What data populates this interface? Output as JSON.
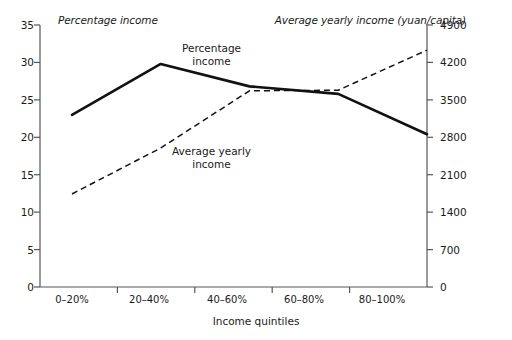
{
  "chart_data": {
    "type": "line",
    "title": "",
    "xlabel": "Income quintiles",
    "categories": [
      "0–20%",
      "20–40%",
      "40–60%",
      "60–80%",
      "80–100%"
    ],
    "grid": false,
    "legend_position": "inline-annotations",
    "axes": {
      "left": {
        "label": "Percentage income",
        "ylim": [
          0,
          35
        ],
        "ticks": [
          0,
          5,
          10,
          15,
          20,
          25,
          30,
          35
        ],
        "tick_labels": [
          "0",
          "5",
          "10",
          "15",
          "20",
          "25",
          "30",
          "35"
        ]
      },
      "right": {
        "label": "Average yearly income (yuan/capita)",
        "ylim": [
          0,
          4900
        ],
        "ticks": [
          0,
          700,
          1400,
          2100,
          2800,
          3500,
          4200,
          4900
        ],
        "tick_labels": [
          "0",
          "700",
          "1400",
          "2100",
          "2800",
          "3500",
          "4200",
          "4900"
        ]
      }
    },
    "series": [
      {
        "name": "Percentage income",
        "axis": "left",
        "style": "solid",
        "color": "#111111",
        "annotation": "Percentage\nincome",
        "annotation_line1": "Percentage",
        "annotation_line2": "income",
        "values": [
          23.0,
          29.8,
          26.8,
          25.8,
          20.4
        ]
      },
      {
        "name": "Average yearly income",
        "axis": "right",
        "style": "dashed",
        "color": "#111111",
        "annotation": "Average yearly\nincome",
        "annotation_line1": "Average yearly",
        "annotation_line2": "income",
        "values": [
          1740,
          2600,
          3670,
          3680,
          4430
        ]
      }
    ]
  }
}
